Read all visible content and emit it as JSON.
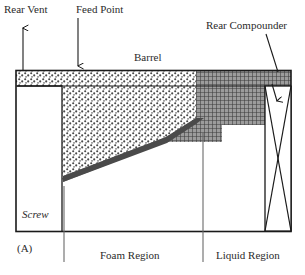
{
  "figure": {
    "panel_label": "(A)",
    "caption_labels": {
      "rear_vent": "Rear Vent",
      "feed_point": "Feed Point",
      "barrel": "Barrel",
      "rear_compounder": "Rear Compounder",
      "screw": "Screw",
      "foam_region": "Foam Region",
      "liquid_region": "Liquid Region"
    },
    "colors": {
      "line": "#1a1a1a",
      "text": "#2b2b2b",
      "foam_fill": "#d9d9d9",
      "liquid_fill": "#8a8a8a",
      "background": "#ffffff"
    }
  },
  "diagram_data": {
    "type": "cross-section-schematic",
    "subject": "Extruder barrel with foam and liquid regions",
    "regions": [
      {
        "name": "foam-region",
        "fill_pattern": "stipple",
        "label": "Foam Region"
      },
      {
        "name": "liquid-region",
        "fill_pattern": "crosshatch",
        "label": "Liquid Region"
      },
      {
        "name": "screw-channel",
        "fill_pattern": "none",
        "label": "Screw"
      }
    ],
    "annotations": [
      {
        "name": "rear-vent",
        "label": "Rear Vent",
        "arrow": "up"
      },
      {
        "name": "feed-point",
        "label": "Feed Point",
        "arrow": "down"
      },
      {
        "name": "barrel",
        "label": "Barrel",
        "arrow": "none"
      },
      {
        "name": "rear-compounder",
        "label": "Rear Compounder",
        "arrow": "down-left"
      }
    ],
    "leader_lines": [
      "foam-region-leader",
      "liquid-region-leader"
    ]
  }
}
